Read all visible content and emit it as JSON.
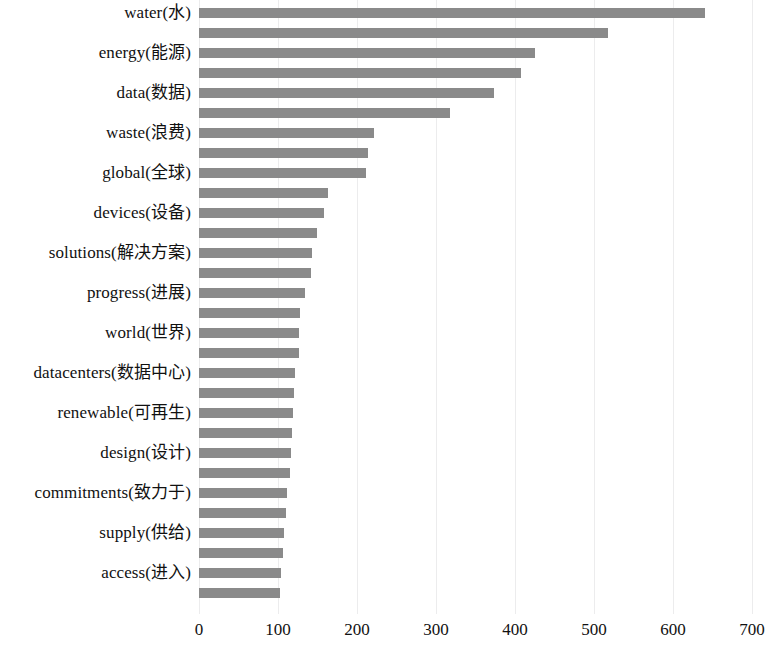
{
  "chart_data": {
    "type": "bar",
    "orientation": "horizontal",
    "title": "",
    "subtitle": "",
    "xlabel": "",
    "ylabel": "",
    "xlim": [
      0,
      700
    ],
    "xticks": [
      0,
      100,
      200,
      300,
      400,
      500,
      600,
      700
    ],
    "xtick_labels": [
      "0",
      "100",
      "200",
      "300",
      "400",
      "500",
      "600",
      "700"
    ],
    "grid": "vertical-only",
    "legend": "none",
    "bar_color": "#8a8a8a",
    "background_color": "#ffffff",
    "label_display_note": "Only every other bar (even index) displays a category label",
    "categories": [
      "water(水)",
      "",
      "energy(能源)",
      "",
      "data(数据)",
      "",
      "waste(浪费)",
      "",
      "global(全球)",
      "",
      "devices(设备)",
      "",
      "solutions(解决方案)",
      "",
      "progress(进展)",
      "",
      "world(世界)",
      "",
      "datacenters(数据中心)",
      "",
      "renewable(可再生)",
      "",
      "design(设计)",
      "",
      "commitments(致力于)",
      "",
      "supply(供给)",
      "",
      "access(进入)",
      ""
    ],
    "values": [
      640,
      518,
      425,
      408,
      374,
      318,
      221,
      214,
      212,
      163,
      158,
      149,
      143,
      142,
      134,
      128,
      127,
      127,
      122,
      120,
      119,
      118,
      116,
      115,
      112,
      110,
      108,
      106,
      104,
      103
    ],
    "visible_labels": [
      "water(水)",
      "energy(能源)",
      "data(数据)",
      "waste(浪费)",
      "global(全球)",
      "devices(设备)",
      "solutions(解决方案)",
      "progress(进展)",
      "world(世界)",
      "datacenters(数据中心)",
      "renewable(可再生)",
      "design(设计)",
      "commitments(致力于)",
      "supply(供给)",
      "access(进入)"
    ]
  },
  "layout": {
    "plot_left_px": 199,
    "plot_top_px": 3,
    "px_per_100_units": 79,
    "row_pitch_px": 20,
    "bar_height_px": 10
  }
}
